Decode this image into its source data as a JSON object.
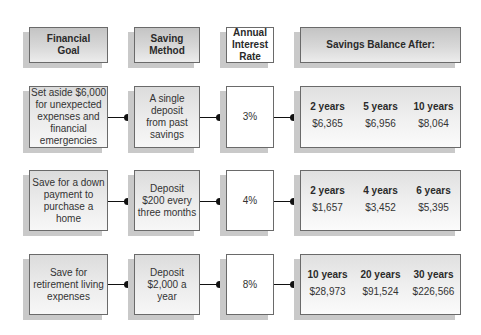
{
  "headers": {
    "goal": "Financial\nGoal",
    "method": "Saving\nMethod",
    "rate": "Annual\nInterest\nRate",
    "balance": "Savings Balance After:"
  },
  "rows": [
    {
      "goal": "Set aside $6,000\nfor unexpected\nexpenses and\nfinancial\nemergencies",
      "method": "A single\ndeposit\nfrom past\nsavings",
      "rate": "3%",
      "balances": [
        {
          "period": "2 years",
          "amount": "$6,365"
        },
        {
          "period": "5 years",
          "amount": "$6,956"
        },
        {
          "period": "10 years",
          "amount": "$8,064"
        }
      ]
    },
    {
      "goal": "Save for a down\npayment to\npurchase a home",
      "method": "Deposit\n$200 every\nthree months",
      "rate": "4%",
      "balances": [
        {
          "period": "2 years",
          "amount": "$1,657"
        },
        {
          "period": "4 years",
          "amount": "$3,452"
        },
        {
          "period": "6 years",
          "amount": "$5,395"
        }
      ]
    },
    {
      "goal": "Save for\nretirement living\nexpenses",
      "method": "Deposit\n$2,000 a\nyear",
      "rate": "8%",
      "balances": [
        {
          "period": "10 years",
          "amount": "$28,973"
        },
        {
          "period": "20 years",
          "amount": "$91,524"
        },
        {
          "period": "30 years",
          "amount": "$226,566"
        }
      ]
    }
  ],
  "colors": {
    "border": "#6a6a6a",
    "connector": "#111111",
    "shadow": "#c9c9c9"
  }
}
